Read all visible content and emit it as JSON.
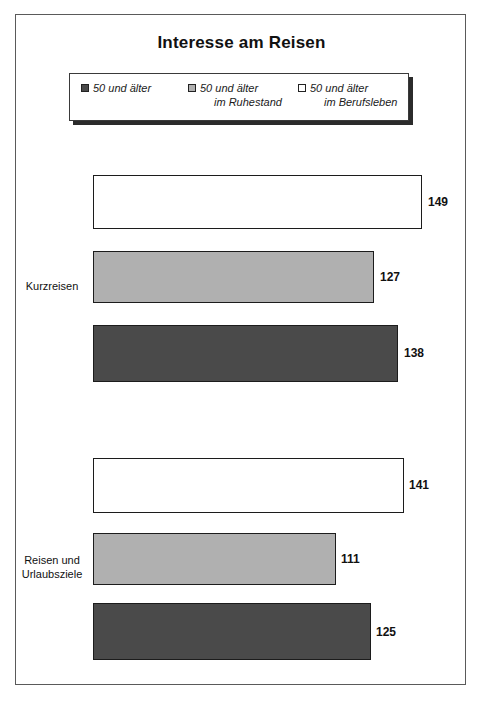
{
  "chart": {
    "title": "Interesse am Reisen"
  },
  "legend": {
    "items": [
      {
        "label_line1": "50 und älter",
        "label_line2": "",
        "swatch": "dark-gray-swatch-icon",
        "color": "#4a4a4a"
      },
      {
        "label_line1": "50 und älter",
        "label_line2": "im Ruhestand",
        "swatch": "light-gray-swatch-icon",
        "color": "#b0b0b0"
      },
      {
        "label_line1": "50 und älter",
        "label_line2": "im Berufsleben",
        "swatch": "white-swatch-icon",
        "color": "#ffffff"
      }
    ]
  },
  "chart_data": {
    "type": "bar",
    "orientation": "horizontal",
    "title": "Interesse am Reisen",
    "xlabel": "",
    "ylabel": "",
    "categories": [
      "Kurzreisen",
      "Reisen und Urlaubsziele"
    ],
    "series": [
      {
        "name": "50 und älter im Berufsleben",
        "color": "#ffffff",
        "values": [
          149,
          141
        ]
      },
      {
        "name": "50 und älter im Ruhestand",
        "color": "#b0b0b0",
        "values": [
          127,
          111
        ]
      },
      {
        "name": "50 und älter",
        "color": "#4a4a4a",
        "values": [
          138,
          125
        ]
      }
    ],
    "xlim": [
      0,
      160
    ],
    "grid": false,
    "legend_position": "top",
    "value_labels": true
  },
  "bars": [
    {
      "name": "bar-kurzreisen-berufsleben",
      "value": "149",
      "left": 77,
      "top": 160,
      "width": 329,
      "height": 54,
      "color": "#ffffff",
      "label_left": 412,
      "label_top": 180
    },
    {
      "name": "bar-kurzreisen-ruhestand",
      "value": "127",
      "left": 77,
      "top": 236,
      "width": 281,
      "height": 52,
      "color": "#b0b0b0",
      "label_left": 364,
      "label_top": 255
    },
    {
      "name": "bar-kurzreisen-50plus",
      "value": "138",
      "left": 77,
      "top": 310,
      "width": 305,
      "height": 57,
      "color": "#4a4a4a",
      "label_left": 388,
      "label_top": 331
    },
    {
      "name": "bar-reisen-urlaubsziele-berufsleben",
      "value": "141",
      "left": 77,
      "top": 443,
      "width": 311,
      "height": 55,
      "color": "#ffffff",
      "label_left": 393,
      "label_top": 463
    },
    {
      "name": "bar-reisen-urlaubsziele-ruhestand",
      "value": "111",
      "left": 77,
      "top": 518,
      "width": 243,
      "height": 52,
      "color": "#b0b0b0",
      "label_left": 325,
      "label_top": 537
    },
    {
      "name": "bar-reisen-urlaubsziele-50plus",
      "value": "125",
      "left": 77,
      "top": 588,
      "width": 278,
      "height": 57,
      "color": "#4a4a4a",
      "label_left": 360,
      "label_top": 610
    }
  ],
  "group_labels": [
    {
      "name": "group-label-kurzreisen",
      "line1": "Kurzreisen",
      "line2": "",
      "left": 0,
      "top": 264,
      "width": 72
    },
    {
      "name": "group-label-reisen-urlaubsziele",
      "line1": "Reisen und",
      "line2": "Urlaubsziele",
      "left": 0,
      "top": 538,
      "width": 72
    }
  ]
}
